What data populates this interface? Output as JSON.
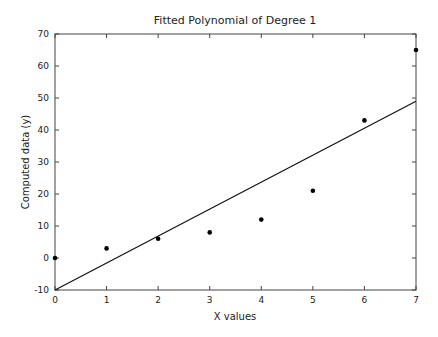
{
  "chart_data": {
    "type": "scatter",
    "title": "Fitted Polynomial of Degree 1",
    "xlabel": "X values",
    "ylabel": "Computed data (y)",
    "xlim": [
      0,
      7
    ],
    "ylim": [
      -10,
      70
    ],
    "xticks": [
      0,
      1,
      2,
      3,
      4,
      5,
      6,
      7
    ],
    "yticks": [
      -10,
      0,
      10,
      20,
      30,
      40,
      50,
      60,
      70
    ],
    "grid": false,
    "legend": null,
    "series": [
      {
        "name": "data points",
        "kind": "scatter",
        "x": [
          0,
          1,
          2,
          3,
          4,
          5,
          6,
          7
        ],
        "y": [
          0,
          3,
          6,
          8,
          12,
          21,
          43,
          65
        ]
      },
      {
        "name": "fitted line (degree 1)",
        "kind": "line",
        "x": [
          0,
          7
        ],
        "y": [
          -10,
          49
        ]
      }
    ]
  }
}
